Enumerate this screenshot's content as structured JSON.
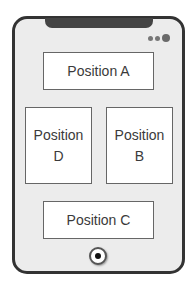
{
  "diagram": {
    "device": "smartphone",
    "positions": {
      "a": {
        "line1": "Position A",
        "line2": ""
      },
      "b": {
        "line1": "Position",
        "line2": "B"
      },
      "c": {
        "line1": "Position C",
        "line2": ""
      },
      "d": {
        "line1": "Position",
        "line2": "D"
      }
    },
    "status_dots": 3,
    "colors": {
      "frame": "#333333",
      "screen": "#ececec",
      "box_fill": "#ffffff",
      "box_border": "#666666",
      "text": "#3a3a3a"
    }
  }
}
